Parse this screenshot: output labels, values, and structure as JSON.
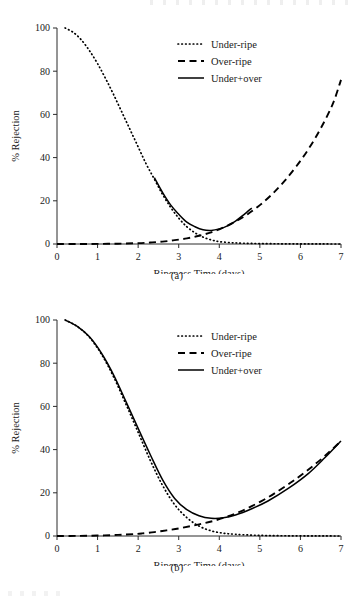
{
  "figures": [
    {
      "id": "a",
      "caption": "(a)",
      "chart": {
        "type": "line",
        "title": "",
        "xlabel": "Ripeness Time (days)",
        "ylabel": "% Rejection",
        "xlim": [
          0,
          7
        ],
        "ylim": [
          0,
          100
        ],
        "xticks": [
          0,
          1,
          2,
          3,
          4,
          5,
          6,
          7
        ],
        "yticks": [
          0,
          20,
          40,
          60,
          80,
          100
        ],
        "grid": false,
        "legend_position": "top-center",
        "series": [
          {
            "name": "Under-ripe",
            "style": "dotted",
            "x": [
              0.2,
              0.4,
              0.6,
              0.8,
              1.0,
              1.2,
              1.4,
              1.6,
              1.8,
              2.0,
              2.2,
              2.4,
              2.6,
              2.8,
              3.0,
              3.2,
              3.4,
              3.6,
              3.8,
              4.0,
              4.3,
              4.6,
              5.0,
              5.5,
              6.0,
              6.5,
              7.0
            ],
            "values": [
              100.0,
              98.0,
              94.5,
              89.5,
              83.5,
              76.5,
              69.0,
              61.0,
              53.0,
              45.0,
              37.0,
              30.0,
              23.0,
              17.0,
              12.0,
              8.0,
              5.2,
              3.2,
              1.9,
              1.1,
              0.6,
              0.35,
              0.2,
              0.1,
              0.05,
              0.02,
              0.0
            ]
          },
          {
            "name": "Over-ripe",
            "style": "dashed",
            "x": [
              0.0,
              0.5,
              1.0,
              1.5,
              2.0,
              2.3,
              2.6,
              2.9,
              3.2,
              3.5,
              3.8,
              4.1,
              4.4,
              4.7,
              5.0,
              5.3,
              5.6,
              5.9,
              6.2,
              6.5,
              6.8,
              7.0
            ],
            "values": [
              0.0,
              0.0,
              0.05,
              0.15,
              0.4,
              0.7,
              1.1,
              1.8,
              2.6,
              3.8,
              5.4,
              7.6,
              10.4,
              13.8,
              18.0,
              23.0,
              29.0,
              36.0,
              44.0,
              53.5,
              65.0,
              76.0
            ]
          },
          {
            "name": "Under+over",
            "style": "solid",
            "x": [
              2.4,
              2.6,
              2.8,
              3.0,
              3.2,
              3.4,
              3.6,
              3.8,
              4.0,
              4.2,
              4.4,
              4.6,
              4.8
            ],
            "values": [
              30.7,
              23.9,
              18.1,
              13.8,
              10.1,
              8.0,
              6.6,
              6.3,
              7.0,
              8.4,
              10.6,
              13.5,
              16.6
            ]
          }
        ]
      }
    },
    {
      "id": "b",
      "caption": "(b)",
      "chart": {
        "type": "line",
        "title": "",
        "xlabel": "Ripeness Time (days)",
        "ylabel": "% Rejection",
        "xlim": [
          0,
          7
        ],
        "ylim": [
          0,
          100
        ],
        "xticks": [
          0,
          1,
          2,
          3,
          4,
          5,
          6,
          7
        ],
        "yticks": [
          0,
          20,
          40,
          60,
          80,
          100
        ],
        "grid": false,
        "legend_position": "top-center",
        "series": [
          {
            "name": "Under-ripe",
            "style": "dotted",
            "x": [
              0.2,
              0.5,
              0.8,
              1.1,
              1.4,
              1.7,
              2.0,
              2.3,
              2.6,
              2.9,
              3.2,
              3.5,
              3.8,
              4.1,
              4.4,
              4.8,
              5.2,
              5.7,
              6.2,
              6.6,
              7.0
            ],
            "values": [
              100.0,
              97.0,
              92.0,
              84.0,
              73.5,
              61.0,
              48.0,
              35.0,
              23.5,
              14.5,
              8.5,
              4.6,
              2.4,
              1.3,
              0.8,
              0.4,
              0.2,
              0.1,
              0.05,
              0.02,
              0.0
            ]
          },
          {
            "name": "Over-ripe",
            "style": "dashed",
            "x": [
              0.0,
              0.5,
              1.0,
              1.5,
              1.9,
              2.1,
              2.4,
              2.7,
              3.0,
              3.3,
              3.6,
              3.9,
              4.2,
              4.5,
              4.8,
              5.1,
              5.4,
              5.8,
              6.2,
              6.6,
              7.0
            ],
            "values": [
              0.0,
              0.05,
              0.2,
              0.5,
              0.9,
              1.2,
              1.8,
              2.6,
              3.5,
              4.6,
              5.8,
              7.2,
              9.0,
              11.2,
              13.8,
              16.8,
              20.2,
              25.2,
              30.8,
              37.0,
              44.0
            ]
          },
          {
            "name": "Under+over",
            "style": "solid",
            "x": [
              0.2,
              0.5,
              0.8,
              1.1,
              1.4,
              1.7,
              2.0,
              2.3,
              2.6,
              2.9,
              3.2,
              3.5,
              3.8,
              4.1,
              4.4,
              4.8,
              5.2,
              5.7,
              6.2,
              6.6,
              7.0
            ],
            "values": [
              100.0,
              97.05,
              92.2,
              84.5,
              74.4,
              62.2,
              49.8,
              37.6,
              26.1,
              17.4,
              12.2,
              9.4,
              8.2,
              8.4,
              9.7,
              12.6,
              16.2,
              22.0,
              29.0,
              36.2,
              44.0
            ]
          }
        ]
      }
    }
  ]
}
